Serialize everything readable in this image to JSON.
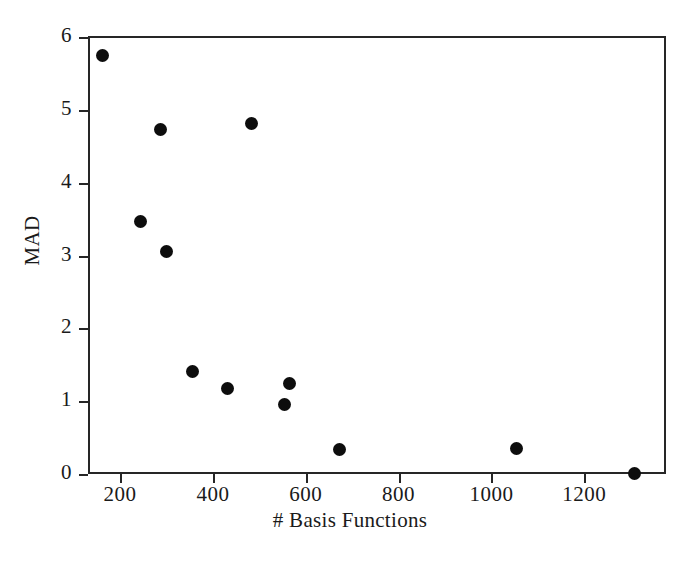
{
  "chart_data": {
    "type": "scatter",
    "title": "",
    "xlabel": "# Basis Functions",
    "ylabel": "MAD",
    "xlim": [
      133,
      1374
    ],
    "ylim": [
      0,
      6
    ],
    "xticks": [
      200,
      400,
      600,
      800,
      1000,
      1200
    ],
    "yticks": [
      0,
      1,
      2,
      3,
      4,
      5,
      6
    ],
    "xtick_labels": [
      "200",
      "400",
      "600",
      "800",
      "1000",
      "1200"
    ],
    "ytick_labels": [
      "0",
      "1",
      "2",
      "3",
      "4",
      "5",
      "6"
    ],
    "grid": false,
    "legend": null,
    "marker": "filled-circle",
    "marker_color": "#0d0d0d",
    "points": [
      {
        "x": 162,
        "y": 5.75
      },
      {
        "x": 287,
        "y": 4.73
      },
      {
        "x": 484,
        "y": 4.81
      },
      {
        "x": 245,
        "y": 3.46
      },
      {
        "x": 299,
        "y": 3.06
      },
      {
        "x": 357,
        "y": 1.41
      },
      {
        "x": 432,
        "y": 1.18
      },
      {
        "x": 565,
        "y": 1.24
      },
      {
        "x": 554,
        "y": 0.96
      },
      {
        "x": 673,
        "y": 0.34
      },
      {
        "x": 1053,
        "y": 0.35
      },
      {
        "x": 1308,
        "y": 0.01
      }
    ]
  },
  "axes": {
    "x_title": "# Basis Functions",
    "y_title": "MAD"
  }
}
